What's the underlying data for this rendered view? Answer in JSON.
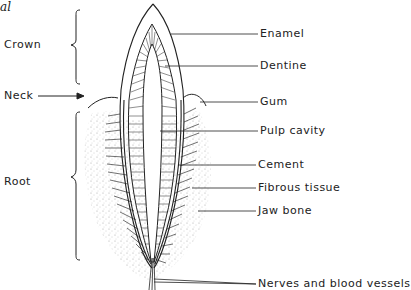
{
  "figure": {
    "type": "tooth cross-section",
    "corner_fragment": "al",
    "regions": [
      {
        "label": "Crown",
        "x": 4,
        "y": 38
      },
      {
        "label": "Neck",
        "x": 4,
        "y": 90
      },
      {
        "label": "Root",
        "x": 4,
        "y": 176
      }
    ],
    "parts": [
      {
        "label": "Enamel",
        "x": 259,
        "y": 28
      },
      {
        "label": "Dentine",
        "x": 259,
        "y": 60
      },
      {
        "label": "Gum",
        "x": 259,
        "y": 96
      },
      {
        "label": "Pulp cavity",
        "x": 259,
        "y": 125
      },
      {
        "label": "Cement",
        "x": 257,
        "y": 159
      },
      {
        "label": "Fibrous tissue",
        "x": 257,
        "y": 182
      },
      {
        "label": "Jaw bone",
        "x": 257,
        "y": 205
      },
      {
        "label": "Nerves and blood vessels",
        "x": 257,
        "y": 279
      }
    ],
    "colors": {
      "line": "#222222",
      "background": "#ffffff",
      "stipple": "#9a9a9a"
    }
  }
}
